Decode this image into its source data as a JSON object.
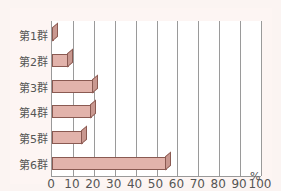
{
  "chart_data": {
    "type": "bar",
    "orientation": "horizontal",
    "categories": [
      "第1群",
      "第2群",
      "第3群",
      "第4群",
      "第5群",
      "第6群"
    ],
    "values": [
      1,
      8,
      20,
      19,
      15,
      55
    ],
    "title": "",
    "xlabel": "%",
    "ylabel": "",
    "xlim": [
      0,
      100
    ],
    "x_ticks": [
      "0",
      "10",
      "20",
      "30",
      "40",
      "50",
      "60",
      "70",
      "80",
      "90",
      "100"
    ],
    "grid": true,
    "bar_color": "#e2b3ab"
  },
  "axis": {
    "unit": "%"
  }
}
